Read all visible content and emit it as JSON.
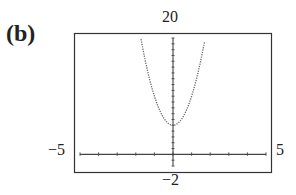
{
  "panel": {
    "label": "(b)"
  },
  "window": {
    "xmin_label": "−5",
    "xmax_label": "5",
    "ymin_label": "−2",
    "ymax_label": "20"
  },
  "chart_data": {
    "type": "line",
    "title": "(b)",
    "xlabel": "",
    "ylabel": "",
    "xlim": [
      -5,
      5
    ],
    "ylim": [
      -2,
      20
    ],
    "grid": false,
    "x_tick_step": 1,
    "y_tick_step": 1,
    "series": [
      {
        "name": "parabola",
        "style": "dotted",
        "x": [
          -1.7,
          -1.5,
          -1.25,
          -1,
          -0.75,
          -0.5,
          -0.25,
          0,
          0.25,
          0.5,
          0.75,
          1,
          1.25,
          1.5,
          1.7
        ],
        "y": [
          19.5,
          16.3,
          12.8,
          10,
          7.8,
          6.3,
          5.3,
          5,
          5.3,
          6.3,
          7.8,
          10,
          12.8,
          16.3,
          19.5
        ]
      }
    ],
    "annotations": [
      "viewing window: [-5, 5] by [-2, 20]"
    ]
  }
}
